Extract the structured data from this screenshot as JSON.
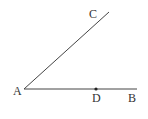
{
  "diagram": {
    "type": "geometry-angle",
    "colors": {
      "line": "#444444",
      "label": "#333333",
      "point": "#222222"
    },
    "points": {
      "A": {
        "label": "A",
        "x": 24,
        "y": 89
      },
      "B": {
        "label": "B",
        "x": 137,
        "y": 89
      },
      "C": {
        "label": "C",
        "x": 109,
        "y": 12
      },
      "D": {
        "label": "D",
        "x": 96,
        "y": 89
      }
    },
    "segments": [
      {
        "from": "A",
        "to": "C"
      },
      {
        "from": "A",
        "to": "B"
      }
    ],
    "marked_points": [
      "D"
    ]
  }
}
